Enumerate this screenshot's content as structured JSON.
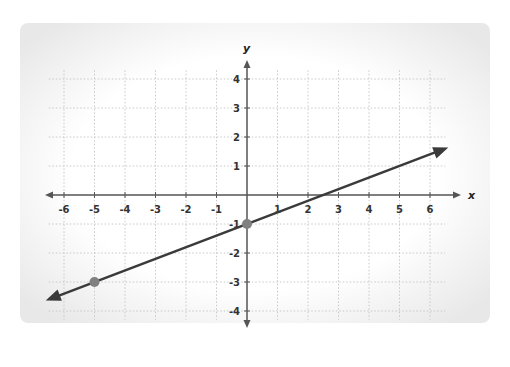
{
  "chart_data": {
    "type": "line",
    "title": "",
    "xlabel": "x",
    "ylabel": "y",
    "xlim": [
      -6.5,
      6.5
    ],
    "ylim": [
      -4.3,
      4.3
    ],
    "x_ticks": [
      "-6",
      "-5",
      "-4",
      "-3",
      "-2",
      "-1",
      "1",
      "2",
      "3",
      "4",
      "5",
      "6"
    ],
    "y_ticks": [
      "4",
      "3",
      "2",
      "1",
      "-1",
      "-2",
      "-3",
      "-4"
    ],
    "grid": true,
    "legend": null,
    "series": [
      {
        "name": "line",
        "equation": "y = 0.4x - 1",
        "slope": 0.4,
        "intercept": -1,
        "direction": "arrows both ends",
        "color": "#3a3a3a"
      }
    ],
    "points": [
      {
        "x": 0,
        "y": -1,
        "color": "#808080"
      },
      {
        "x": -5,
        "y": -3,
        "color": "#808080"
      }
    ]
  },
  "colors": {
    "background": "#ffffff",
    "panel": "#f2f2f2",
    "grid": "#c8c8c8",
    "axis": "#555555",
    "line": "#3a3a3a",
    "point": "#808080"
  }
}
